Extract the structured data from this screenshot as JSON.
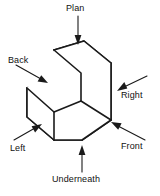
{
  "figure": {
    "background_color": "#ffffff",
    "line_color": "#1a1a1a",
    "face_fill": "#ffffff"
  },
  "labels": {
    "plan": "Plan",
    "back": "Back",
    "right": "Right",
    "left": "Left",
    "front": "Front",
    "underneath": "Underneath"
  },
  "annotations": [
    {
      "name": "plan",
      "label": "Plan",
      "arrow_direction": "down",
      "points_at": "top-face"
    },
    {
      "name": "back",
      "label": "Back",
      "arrow_direction": "down-right",
      "points_at": "rear-face"
    },
    {
      "name": "right",
      "label": "Right",
      "arrow_direction": "up-left",
      "points_at": "right-face"
    },
    {
      "name": "left",
      "label": "Left",
      "arrow_direction": "up-right",
      "points_at": "left-face"
    },
    {
      "name": "front",
      "label": "Front",
      "arrow_direction": "up-left",
      "points_at": "front-face"
    },
    {
      "name": "underneath",
      "label": "Underneath",
      "arrow_direction": "up",
      "points_at": "bottom-face"
    }
  ],
  "solid": {
    "type": "L-shaped stepped block",
    "visible_faces": [
      "upper-top",
      "step-tread",
      "step-riser",
      "front-lower",
      "front-upper",
      "right-side"
    ]
  }
}
